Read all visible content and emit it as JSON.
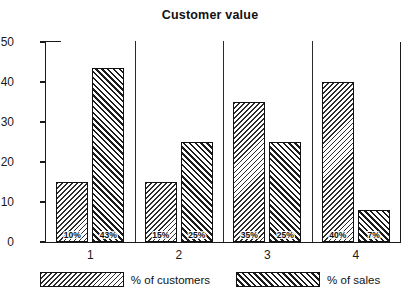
{
  "chart_data": {
    "type": "bar",
    "title": "Customer value",
    "xlabel": "",
    "ylabel": "",
    "ylim": [
      0,
      50
    ],
    "yticks": [
      0,
      10,
      20,
      30,
      40,
      50
    ],
    "grid": false,
    "legend_position": "bottom",
    "categories": [
      "1",
      "2",
      "3",
      "4"
    ],
    "series": [
      {
        "name": "% of customers",
        "hatch": "backslash",
        "values": [
          15,
          15,
          35,
          40
        ],
        "labels": [
          "10%",
          "15%",
          "35%",
          "40%"
        ]
      },
      {
        "name": "% of sales",
        "hatch": "forwardslash",
        "values": [
          43.5,
          25,
          25,
          8
        ],
        "labels": [
          "43%",
          "25%",
          "25%",
          "7%"
        ]
      }
    ]
  },
  "axis": {
    "y_tick_labels": [
      "0",
      "10",
      "20",
      "30",
      "40",
      "50"
    ]
  },
  "legend": {
    "items": [
      {
        "label": "% of customers"
      },
      {
        "label": "% of sales"
      }
    ]
  }
}
